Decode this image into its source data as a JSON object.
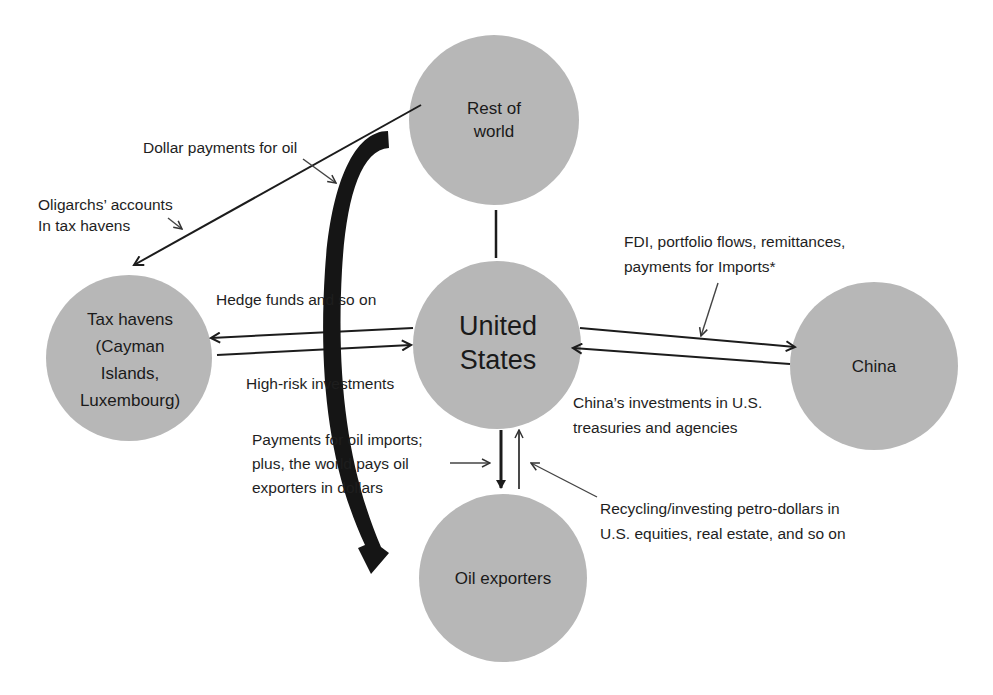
{
  "colors": {
    "node_fill": "#b7b7b7",
    "line": "#1c1c1c",
    "background": "#ffffff"
  },
  "nodes": {
    "rest_of_world": {
      "line1": "Rest of",
      "line2": "world"
    },
    "united_states": {
      "line1": "United",
      "line2": "States"
    },
    "tax_havens": {
      "line1": "Tax havens",
      "line2": "(Cayman",
      "line3": "Islands,",
      "line4": "Luxembourg)"
    },
    "china": {
      "line1": "China"
    },
    "oil_exporters": {
      "line1": "Oil exporters"
    }
  },
  "labels": {
    "dollar_payments": "Dollar payments for oil",
    "oligarchs_line1": "Oligarchs’ accounts",
    "oligarchs_line2": "In tax havens",
    "hedge_funds": "Hedge funds and so on",
    "high_risk": "High-risk investments",
    "fdi_line1": "FDI, portfolio flows, remittances,",
    "fdi_line2": "payments for Imports*",
    "china_inv_line1": "China’s investments in U.S.",
    "china_inv_line2": "treasuries and agencies",
    "oil_pay_line1": "Payments for oil imports;",
    "oil_pay_line2": "plus, the world pays oil",
    "oil_pay_line3": "exporters in dollars",
    "recycling_line1": "Recycling/investing petro-dollars in",
    "recycling_line2": "U.S. equities, real estate, and so on"
  }
}
